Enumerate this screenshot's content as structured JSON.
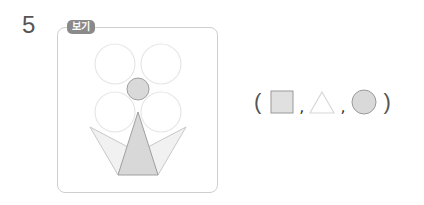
{
  "question": {
    "number": "5",
    "example_badge": "보기"
  },
  "example_figure": {
    "description": "flower made of 4 large light circles, 1 small filled center circle, and 3 triangles forming a crown/vase",
    "shapes_used": [
      "circle",
      "triangle"
    ]
  },
  "answer_choices": {
    "open_paren": "(",
    "close_paren": ")",
    "separator": ",",
    "options": [
      {
        "shape": "square",
        "fill": "#e0e0e0",
        "stroke": "#9a9a9a"
      },
      {
        "shape": "triangle",
        "fill": "#ffffff",
        "stroke": "#d8d8d8"
      },
      {
        "shape": "circle",
        "fill": "#d9d9d9",
        "stroke": "#9a9a9a"
      }
    ]
  },
  "colors": {
    "frame_border": "#cfcfcf",
    "badge_bg": "#8a8a8a",
    "text": "#555555"
  }
}
